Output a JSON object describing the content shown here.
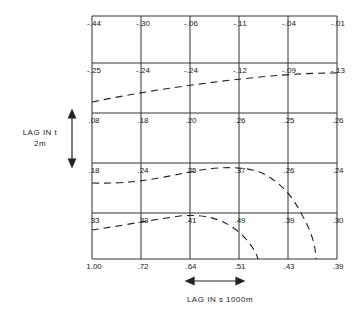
{
  "diagram": {
    "title": "",
    "x_axis_label": "LAG IN s 1000m",
    "y_axis_label_line1": "LAG IN t",
    "y_axis_label_line2": "2m",
    "columns": 6,
    "rows": 6,
    "grid_values": [
      [
        "-.44",
        "-.30",
        "-.06",
        "-.11",
        "-.04",
        "-.01"
      ],
      [
        "-.25",
        "-.24",
        "-.24",
        "-.12",
        "-.09",
        "-.13"
      ],
      [
        ".08",
        ".18",
        ".20",
        ".26",
        ".25",
        ".26"
      ],
      [
        ".18",
        ".24",
        ".25",
        ".37",
        ".26",
        ".24"
      ],
      [
        ".33",
        ".33",
        ".41",
        ".49",
        ".39",
        ".30"
      ],
      [
        "1.00",
        ".72",
        ".64",
        ".51",
        ".43",
        ".39"
      ]
    ],
    "contours": [
      {
        "name": "contour-upper",
        "style": "dashed"
      },
      {
        "name": "contour-middle",
        "style": "dashed"
      },
      {
        "name": "contour-lower",
        "style": "dashed"
      },
      {
        "name": "contour-outer-arc",
        "style": "dashed"
      }
    ],
    "line_color": "#222222"
  }
}
